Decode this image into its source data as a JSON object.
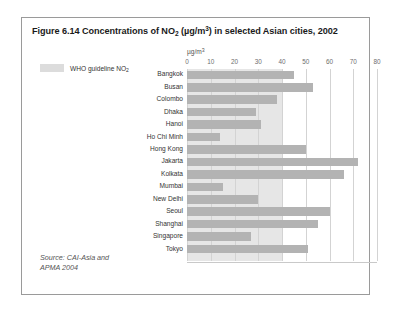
{
  "figure": {
    "title_prefix": "Figure 6.14 Concentrations of NO",
    "title_sub": "2",
    "title_mid": " (µg/m",
    "title_sup": "3",
    "title_suffix": ") in selected Asian cities, 2002",
    "title_full": "Figure 6.14 Concentrations of NO2 (µg/m3) in selected Asian cities, 2002"
  },
  "legend": {
    "label_text": "WHO guideline NO",
    "label_sub": "2",
    "swatch_color": "#dcdcdc"
  },
  "source": {
    "line1": "Source: CAI-Asia and",
    "line2": "APMA 2004"
  },
  "axis": {
    "unit_prefix": "µg/m",
    "unit_sup": "3"
  },
  "colors": {
    "bar": "#b3b3b3",
    "who_band": "#e6e6e6",
    "gridline": "#d3d3d3",
    "border": "#9a9a9a",
    "text": "#333333"
  },
  "chart_data": {
    "type": "bar",
    "orientation": "horizontal",
    "title": "Figure 6.14 Concentrations of NO2 (µg/m3) in selected Asian cities, 2002",
    "xlabel": "µg/m3",
    "ylabel": "",
    "xlim": [
      0,
      80
    ],
    "xticks": [
      0,
      10,
      20,
      30,
      40,
      50,
      60,
      70,
      80
    ],
    "grid": true,
    "legend_position": "top-left",
    "who_guideline": 40,
    "categories": [
      "Bangkok",
      "Busan",
      "Colombo",
      "Dhaka",
      "Hanoi",
      "Ho Chi Minh",
      "Hong Kong",
      "Jakarta",
      "Kolkata",
      "Mumbai",
      "New Delhi",
      "Seoul",
      "Shanghai",
      "Singapore",
      "Tokyo"
    ],
    "values": [
      45,
      53,
      38,
      29,
      31,
      14,
      50,
      72,
      66,
      15,
      30,
      60,
      55,
      27,
      51
    ],
    "series": [
      {
        "name": "NO2 concentration",
        "values": [
          45,
          53,
          38,
          29,
          31,
          14,
          50,
          72,
          66,
          15,
          30,
          60,
          55,
          27,
          51
        ]
      }
    ]
  }
}
